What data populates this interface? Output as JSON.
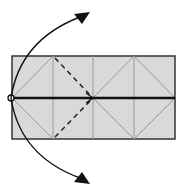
{
  "diagram": {
    "type": "origami-fold-diagram",
    "paper": {
      "x": 12,
      "y": 56,
      "width": 163,
      "height": 83,
      "fill": "#d9d9d9",
      "stroke": "#333333"
    },
    "colors": {
      "crease": "#9a9a9a",
      "valley": "#222222",
      "arrow": "#111111",
      "fold_line": "#111111"
    },
    "vertical_creases": [
      53,
      93,
      134
    ],
    "pivot_point": {
      "x": 11,
      "y": 98
    }
  }
}
